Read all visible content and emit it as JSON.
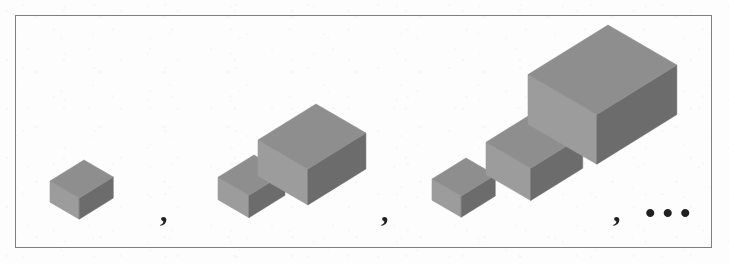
{
  "figure": {
    "name": "cube-sequence-figure",
    "background_color": "#fdfdfd",
    "border_color": "#7e7e82"
  },
  "palette": {
    "top_face": "#8e8e8e",
    "left_face": "#9b9b9b",
    "right_face": "#6c6c6c",
    "edge": "#6f6f6f",
    "ink": "#232326"
  },
  "groups": [
    {
      "id": "group-1",
      "label": "group-one-cube",
      "count": 1,
      "cubes": [
        {
          "id": "g1-c1",
          "x": 50,
          "y": 160,
          "size": 34
        }
      ]
    },
    {
      "id": "group-2",
      "label": "group-two-cubes",
      "count": 2,
      "cubes": [
        {
          "id": "g2-c1",
          "x": 218,
          "y": 155,
          "size": 36
        },
        {
          "id": "g2-c2",
          "x": 258,
          "y": 104,
          "size": 58
        }
      ]
    },
    {
      "id": "group-3",
      "label": "group-three-cubes",
      "count": 3,
      "cubes": [
        {
          "id": "g3-c1",
          "x": 432,
          "y": 158,
          "size": 34
        },
        {
          "id": "g3-c2",
          "x": 486,
          "y": 110,
          "size": 52
        },
        {
          "id": "g3-c3",
          "x": 528,
          "y": 25,
          "size": 80
        }
      ]
    }
  ],
  "separators": [
    {
      "id": "sep-1",
      "symbol": ",",
      "x": 160,
      "y": 196
    },
    {
      "id": "sep-2",
      "symbol": ",",
      "x": 381,
      "y": 196
    },
    {
      "id": "sep-3",
      "symbol": ",",
      "x": 613,
      "y": 196
    }
  ],
  "ellipsis": {
    "id": "ellipsis",
    "symbol": "•••",
    "x": 645,
    "y": 198
  }
}
